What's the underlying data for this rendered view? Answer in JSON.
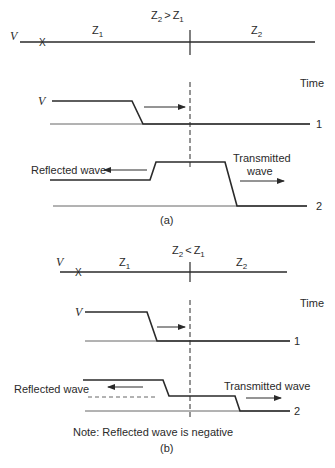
{
  "panel_a": {
    "caption": "(a)",
    "condition": {
      "z_left": "Z",
      "sub_left": "2",
      "op": ">",
      "z_right": "Z",
      "sub_right": "1"
    },
    "line_source_label": "V",
    "fault_marker": "X",
    "segment_left": {
      "z": "Z",
      "sub": "1"
    },
    "segment_right": {
      "z": "Z",
      "sub": "2"
    },
    "time_label": "Time",
    "wave1": {
      "level_label": "V",
      "row_label": "1"
    },
    "wave2": {
      "row_label": "2"
    },
    "reflected_label": "Reflected wave",
    "transmitted_label_line1": "Transmitted",
    "transmitted_label_line2": "wave"
  },
  "panel_b": {
    "caption": "(b)",
    "condition": {
      "z_left": "Z",
      "sub_left": "2",
      "op": "<",
      "z_right": "Z",
      "sub_right": "1"
    },
    "line_source_label": "V",
    "fault_marker": "X",
    "segment_left": {
      "z": "Z",
      "sub": "1"
    },
    "segment_right": {
      "z": "Z",
      "sub": "2"
    },
    "time_label": "Time",
    "wave1": {
      "level_label": "V",
      "row_label": "1"
    },
    "wave2": {
      "row_label": "2"
    },
    "reflected_label": "Reflected wave",
    "transmitted_label": "Transmitted wave",
    "note": "Note: Reflected wave is negative"
  },
  "colors": {
    "line": "#2a2a2a",
    "thin_line": "#555555",
    "background": "#ffffff"
  }
}
